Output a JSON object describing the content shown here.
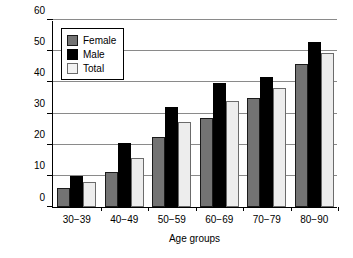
{
  "chart_data": {
    "type": "bar",
    "title": "",
    "xlabel": "Age groups",
    "ylabel": "Mean percentage",
    "ylim": [
      0,
      60
    ],
    "yticks": [
      0,
      10,
      20,
      30,
      40,
      50,
      60
    ],
    "ytick_labels": [
      "0",
      "10",
      "20",
      "30",
      "40",
      "50",
      "60"
    ],
    "grid": true,
    "grid_axis": "y",
    "legend_position": "upper left",
    "categories": [
      "30−39",
      "40−49",
      "50−59",
      "60−69",
      "70−79",
      "80−90"
    ],
    "series": [
      {
        "name": "Female",
        "color": "#737373",
        "values": [
          6.0,
          11.2,
          22.6,
          28.6,
          35.0,
          46.0
        ]
      },
      {
        "name": "Male",
        "color": "#000000",
        "values": [
          9.9,
          20.5,
          32.0,
          39.9,
          41.8,
          53.0
        ]
      },
      {
        "name": "Total",
        "color": "#ededed",
        "values": [
          7.9,
          15.8,
          27.4,
          33.9,
          38.3,
          49.5
        ]
      }
    ]
  },
  "legend": {
    "items": [
      {
        "label": "Female",
        "swatch": "female"
      },
      {
        "label": "Male",
        "swatch": "male"
      },
      {
        "label": "Total",
        "swatch": "total"
      }
    ]
  }
}
